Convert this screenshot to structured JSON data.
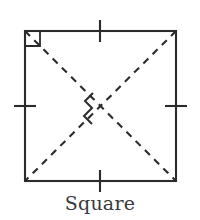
{
  "figure": {
    "name": "square-geometry-figure",
    "caption": "Square",
    "colors": {
      "background": "#ffffff",
      "stroke": "#2b2b2b",
      "caption_text": "#3a3a3a"
    },
    "geometry": {
      "square": {
        "left": 25,
        "top": 31,
        "right": 176,
        "bottom": 181,
        "width": 151,
        "height": 150,
        "stroke_width": 2.1
      },
      "diagonals": {
        "style": "dashed",
        "dash_length": 7,
        "dash_gap": 6,
        "stroke_width": 2.1,
        "lines": [
          {
            "name": "diagonal-top-left-to-bottom-right",
            "x1": 25,
            "y1": 31,
            "x2": 176,
            "y2": 181
          },
          {
            "name": "diagonal-top-right-to-bottom-left",
            "x1": 176,
            "y1": 31,
            "x2": 25,
            "y2": 181
          }
        ]
      },
      "right_angle_marker": {
        "name": "right-angle-marker-top-left",
        "corner_x": 25,
        "corner_y": 31,
        "size": 15,
        "stroke_width": 1.8
      },
      "perpendicular_marker": {
        "name": "perpendicular-marker-center",
        "center_x": 100,
        "center_y": 106,
        "points": "93,93 85,101 92,108 84,116 92,124",
        "stroke_width": 2.0
      },
      "tick_marks": {
        "stroke_width": 2.1,
        "length": 22,
        "items": [
          {
            "name": "tick-mark-top",
            "side": "top",
            "x1": 100,
            "y1": 20,
            "x2": 100,
            "y2": 42
          },
          {
            "name": "tick-mark-right",
            "side": "right",
            "x1": 165,
            "y1": 106,
            "x2": 187,
            "y2": 106
          },
          {
            "name": "tick-mark-bottom",
            "side": "bottom",
            "x1": 100,
            "y1": 170,
            "x2": 100,
            "y2": 192
          },
          {
            "name": "tick-mark-left",
            "side": "left",
            "x1": 14,
            "y1": 106,
            "x2": 36,
            "y2": 106
          }
        ]
      }
    }
  }
}
